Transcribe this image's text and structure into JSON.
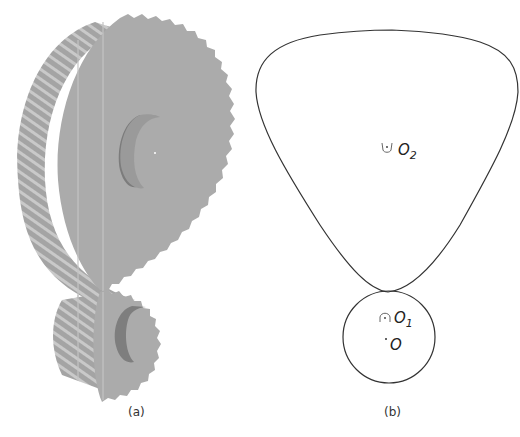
{
  "figure": {
    "panels": [
      {
        "id": "a",
        "caption": "(a)",
        "description": "3D rendering of meshing non-circular helical gear pair",
        "colors": {
          "gear_face": "#a9a9a9",
          "gear_shadow": "#8f8f8f",
          "gear_highlight": "#c8c8c8"
        }
      },
      {
        "id": "b",
        "caption": "(b)",
        "description": "Pitch curves of the gear pair",
        "labels": {
          "o2": "O",
          "o2_sub": "2",
          "o1": "O",
          "o1_sub": "1",
          "o": "O"
        },
        "colors": {
          "curve": "#333333"
        }
      }
    ]
  }
}
